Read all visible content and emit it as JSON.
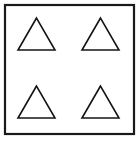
{
  "figure": {
    "canvas": {
      "width": 140,
      "height": 141,
      "background_color": "#ffffff"
    },
    "frame": {
      "name": "square-border",
      "shape": "rectangle",
      "x": 5,
      "y": 5,
      "width": 129,
      "height": 129,
      "stroke_color": "#1a1a1a",
      "stroke_width": 2.2,
      "fill_color": "#ffffff"
    },
    "shapes": {
      "type": "triangle",
      "count": 4,
      "arrangement": "2x2 grid",
      "stroke_color": "#141414",
      "stroke_width": 1.6,
      "fill_color": "#ffffff",
      "items": [
        {
          "id": "triangle-top-left",
          "position_label": "top-left",
          "apex_x": 36.5,
          "apex_y": 18,
          "base_left_x": 18,
          "base_right_x": 55,
          "base_y": 50,
          "width": 37,
          "height": 32,
          "points": "36.5,18 18,50 55,50"
        },
        {
          "id": "triangle-top-right",
          "position_label": "top-right",
          "apex_x": 100.5,
          "apex_y": 18,
          "base_left_x": 82,
          "base_right_x": 119,
          "base_y": 50,
          "width": 37,
          "height": 32,
          "points": "100.5,18 82,50 119,50"
        },
        {
          "id": "triangle-bottom-left",
          "position_label": "bottom-left",
          "apex_x": 36.5,
          "apex_y": 86,
          "base_left_x": 18,
          "base_right_x": 55,
          "base_y": 118,
          "width": 37,
          "height": 32,
          "points": "36.5,86 18,118 55,118"
        },
        {
          "id": "triangle-bottom-right",
          "position_label": "bottom-right",
          "apex_x": 100.5,
          "apex_y": 86,
          "base_left_x": 82,
          "base_right_x": 119,
          "base_y": 118,
          "width": 37,
          "height": 32,
          "points": "100.5,86 82,118 119,118"
        }
      ]
    }
  }
}
